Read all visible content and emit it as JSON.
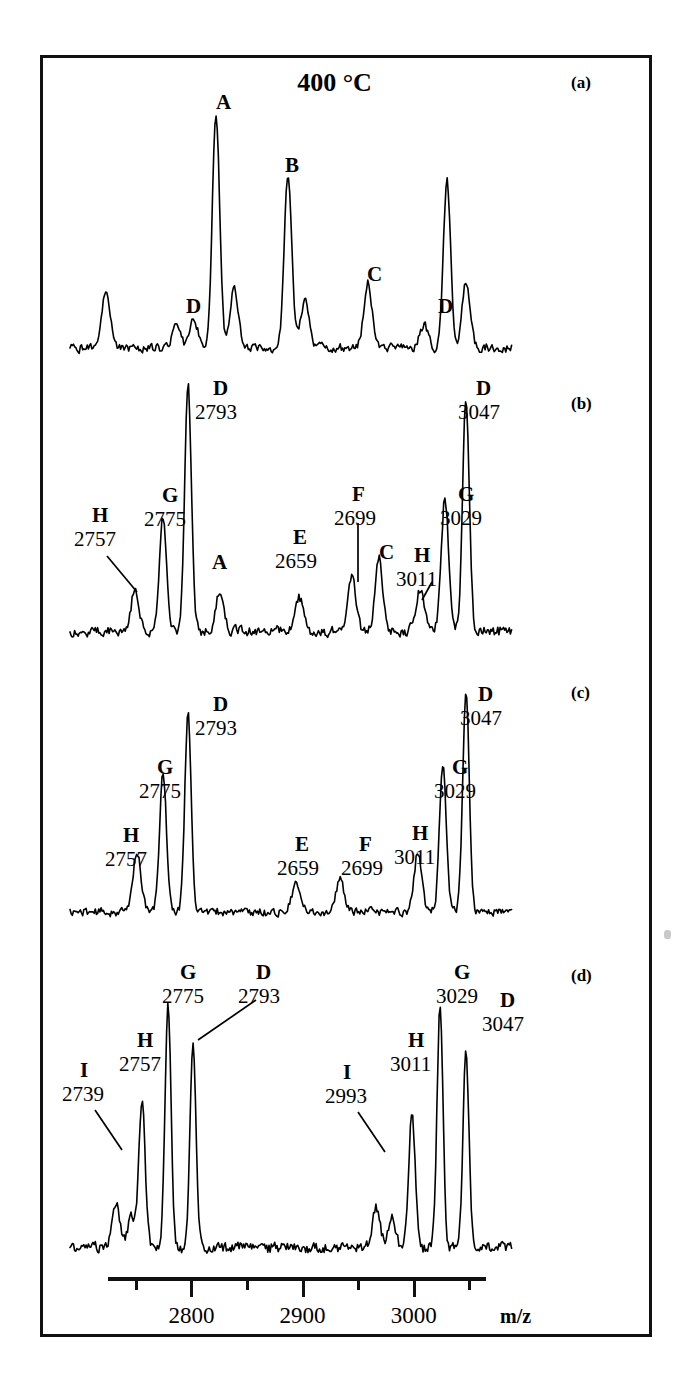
{
  "figure": {
    "title": "400 °C",
    "axis": {
      "label": "m/z",
      "tick_labels": [
        "2800",
        "2900",
        "3000"
      ],
      "tick_values": [
        2800,
        2900,
        3000
      ],
      "minor_tick_values": [
        2750,
        2850,
        2950,
        3050
      ],
      "range": [
        2725,
        3065
      ]
    }
  },
  "panels": [
    {
      "tag": "(a)",
      "annotations": [
        {
          "letter": "A",
          "mass": "",
          "x": 216,
          "y_letter": 92
        },
        {
          "letter": "B",
          "mass": "",
          "x": 285,
          "y_letter": 155
        },
        {
          "letter": "C",
          "mass": "",
          "x": 367,
          "y_letter": 264
        },
        {
          "letter": "D",
          "mass": "",
          "x": 186,
          "y_letter": 296
        },
        {
          "letter": "D",
          "mass": "",
          "x": 438,
          "y_letter": 296
        }
      ]
    },
    {
      "tag": "(b)",
      "annotations": [
        {
          "letter": "H",
          "mass": "2757",
          "x": 92,
          "y_letter": 505
        },
        {
          "letter": "G",
          "mass": "2775",
          "x": 162,
          "y_letter": 485
        },
        {
          "letter": "D",
          "mass": "2793",
          "x": 213,
          "y_letter": 378
        },
        {
          "letter": "A",
          "mass": "",
          "x": 212,
          "y_letter": 552
        },
        {
          "letter": "E",
          "mass": "2659",
          "x": 293,
          "y_letter": 527
        },
        {
          "letter": "F",
          "mass": "2699",
          "x": 352,
          "y_letter": 484
        },
        {
          "letter": "C",
          "mass": "",
          "x": 379,
          "y_letter": 542
        },
        {
          "letter": "H",
          "mass": "3011",
          "x": 414,
          "y_letter": 545
        },
        {
          "letter": "G",
          "mass": "3029",
          "x": 458,
          "y_letter": 484
        },
        {
          "letter": "D",
          "mass": "3047",
          "x": 476,
          "y_letter": 378
        }
      ]
    },
    {
      "tag": "(c)",
      "annotations": [
        {
          "letter": "H",
          "mass": "2757",
          "x": 123,
          "y_letter": 825
        },
        {
          "letter": "G",
          "mass": "2775",
          "x": 157,
          "y_letter": 757
        },
        {
          "letter": "D",
          "mass": "2793",
          "x": 213,
          "y_letter": 694
        },
        {
          "letter": "E",
          "mass": "2659",
          "x": 295,
          "y_letter": 834
        },
        {
          "letter": "F",
          "mass": "2699",
          "x": 359,
          "y_letter": 834
        },
        {
          "letter": "H",
          "mass": "3011",
          "x": 412,
          "y_letter": 823
        },
        {
          "letter": "G",
          "mass": "3029",
          "x": 452,
          "y_letter": 757
        },
        {
          "letter": "D",
          "mass": "3047",
          "x": 478,
          "y_letter": 684
        }
      ]
    },
    {
      "tag": "(d)",
      "annotations": [
        {
          "letter": "I",
          "mass": "2739",
          "x": 80,
          "y_letter": 1060
        },
        {
          "letter": "H",
          "mass": "2757",
          "x": 137,
          "y_letter": 1030
        },
        {
          "letter": "G",
          "mass": "2775",
          "x": 180,
          "y_letter": 962
        },
        {
          "letter": "D",
          "mass": "2793",
          "x": 256,
          "y_letter": 962
        },
        {
          "letter": "I",
          "mass": "2993",
          "x": 343,
          "y_letter": 1062
        },
        {
          "letter": "H",
          "mass": "3011",
          "x": 408,
          "y_letter": 1030
        },
        {
          "letter": "G",
          "mass": "3029",
          "x": 454,
          "y_letter": 962
        },
        {
          "letter": "D",
          "mass": "3047",
          "x": 500,
          "y_letter": 990
        }
      ]
    }
  ],
  "chart_data": {
    "type": "line",
    "title": "400 °C",
    "xlabel": "m/z",
    "ylabel": "",
    "xlim": [
      2725,
      3065
    ],
    "grid": false,
    "legend": "none",
    "series": [
      {
        "name": "(a)",
        "labeled_peaks": [
          {
            "label": "A",
            "mz": null,
            "relative_height": 1.0
          },
          {
            "label": "B",
            "mz": null,
            "relative_height": 0.74
          },
          {
            "label": "C",
            "mz": null,
            "relative_height": 0.26
          },
          {
            "label": "D",
            "mz": null,
            "relative_height": 0.06
          },
          {
            "label": "D",
            "mz": null,
            "relative_height": 0.07
          }
        ]
      },
      {
        "name": "(b)",
        "labeled_peaks": [
          {
            "label": "H",
            "mz": 2757,
            "relative_height": 0.17
          },
          {
            "label": "G",
            "mz": 2775,
            "relative_height": 0.46
          },
          {
            "label": "D",
            "mz": 2793,
            "relative_height": 1.0
          },
          {
            "label": "A",
            "mz": null,
            "relative_height": 0.15
          },
          {
            "label": "E",
            "mz": 2659,
            "relative_height": 0.12
          },
          {
            "label": "F",
            "mz": 2699,
            "relative_height": 0.2
          },
          {
            "label": "C",
            "mz": null,
            "relative_height": 0.27
          },
          {
            "label": "H",
            "mz": 3011,
            "relative_height": 0.16
          },
          {
            "label": "G",
            "mz": 3029,
            "relative_height": 0.5
          },
          {
            "label": "D",
            "mz": 3047,
            "relative_height": 0.93
          }
        ]
      },
      {
        "name": "(c)",
        "labeled_peaks": [
          {
            "label": "H",
            "mz": 2757,
            "relative_height": 0.25
          },
          {
            "label": "G",
            "mz": 2775,
            "relative_height": 0.62
          },
          {
            "label": "D",
            "mz": 2793,
            "relative_height": 0.88
          },
          {
            "label": "E",
            "mz": 2659,
            "relative_height": 0.1
          },
          {
            "label": "F",
            "mz": 2699,
            "relative_height": 0.12
          },
          {
            "label": "H",
            "mz": 3011,
            "relative_height": 0.26
          },
          {
            "label": "G",
            "mz": 3029,
            "relative_height": 0.63
          },
          {
            "label": "D",
            "mz": 3047,
            "relative_height": 1.0
          }
        ]
      },
      {
        "name": "(d)",
        "labeled_peaks": [
          {
            "label": "I",
            "mz": 2739,
            "relative_height": 0.18
          },
          {
            "label": "H",
            "mz": 2757,
            "relative_height": 0.6
          },
          {
            "label": "G",
            "mz": 2775,
            "relative_height": 1.0
          },
          {
            "label": "D",
            "mz": 2793,
            "relative_height": 0.86
          },
          {
            "label": "I",
            "mz": 2993,
            "relative_height": 0.16
          },
          {
            "label": "H",
            "mz": 3011,
            "relative_height": 0.55
          },
          {
            "label": "G",
            "mz": 3029,
            "relative_height": 0.98
          },
          {
            "label": "D",
            "mz": 3047,
            "relative_height": 0.8
          }
        ]
      }
    ]
  }
}
